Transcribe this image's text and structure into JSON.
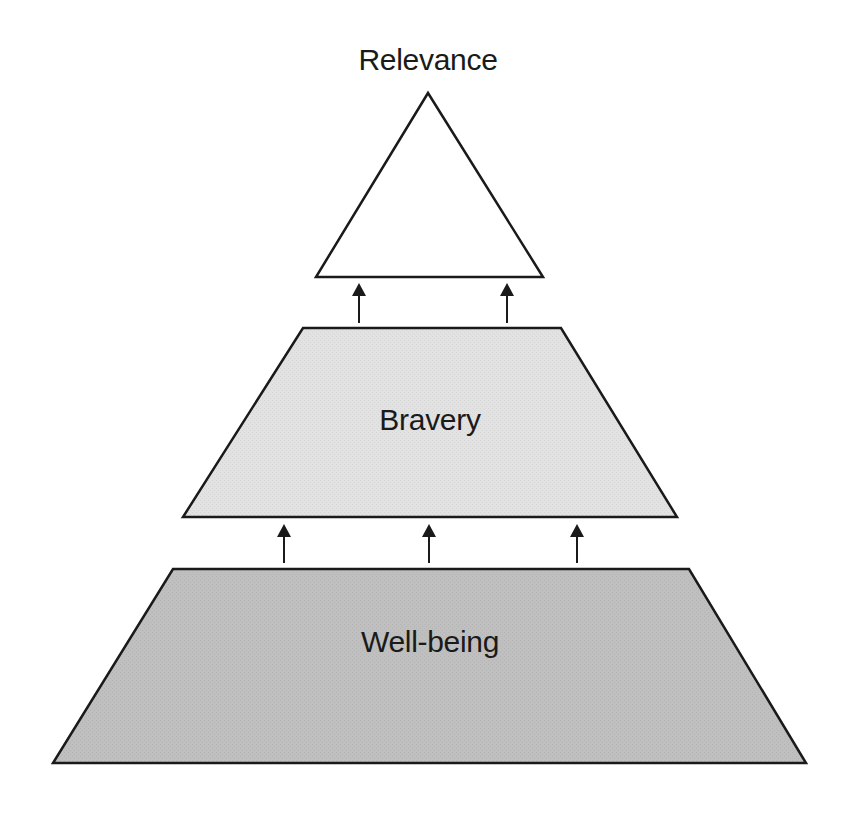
{
  "diagram": {
    "type": "pyramid",
    "levels": [
      {
        "id": "top",
        "label": "Relevance",
        "fill": "#ffffff",
        "label_position": "above"
      },
      {
        "id": "middle",
        "label": "Bravery",
        "fill": "#e2e2e2"
      },
      {
        "id": "bottom",
        "label": "Well-being",
        "fill": "#bfbfbf"
      }
    ],
    "arrows": [
      {
        "from": "middle",
        "to": "top",
        "count": 2
      },
      {
        "from": "bottom",
        "to": "middle",
        "count": 3
      }
    ],
    "stroke_color": "#1a1a1a"
  }
}
